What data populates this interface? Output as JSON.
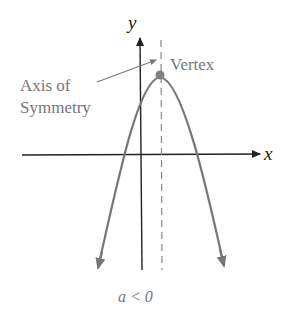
{
  "diagram": {
    "axis_labels": {
      "x": "x",
      "y": "y"
    },
    "annotations": {
      "vertex": "Vertex",
      "axis_of_symmetry_line1": "Axis of",
      "axis_of_symmetry_line2": "Symmetry"
    },
    "caption": "a < 0",
    "colors": {
      "axes": "#222222",
      "curve": "#777777",
      "vertex_point": "#808080",
      "text": "#777777"
    }
  }
}
